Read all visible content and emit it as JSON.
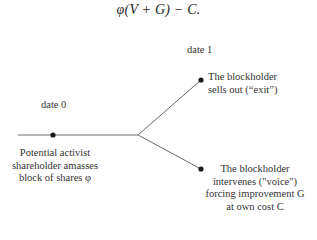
{
  "formula": {
    "text": "φ(V + G) − C."
  },
  "timeline": {
    "date0": "date 0",
    "date1": "date 1"
  },
  "nodes": {
    "start": {
      "lines": [
        "Potential activist",
        "shareholder amasses",
        "block of shares φ"
      ]
    },
    "exit": {
      "lines": [
        "The blockholder",
        "sells out (“exit”)"
      ]
    },
    "voice": {
      "lines": [
        "The blockholder",
        "intervenes (\"voice\")",
        "forcing improvement G",
        "at own cost C"
      ]
    }
  },
  "colors": {
    "line": "#6a6a6a",
    "dot": "#1a1a1a",
    "text": "#333333"
  }
}
